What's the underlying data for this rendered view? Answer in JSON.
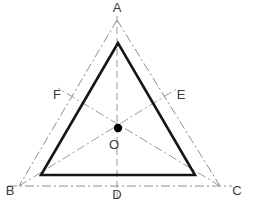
{
  "figure": {
    "type": "geometry-diagram",
    "canvas": {
      "width": 256,
      "height": 208,
      "background": "#ffffff"
    },
    "colors": {
      "construction_line": "#8d8d8d",
      "median_line": "#9a9a9a",
      "inner_triangle": "#161616",
      "centroid": "#000000",
      "label_text": "#3a3a3a"
    },
    "points": {
      "A": {
        "label": "A",
        "x": 117,
        "y": 20,
        "label_x": 117,
        "label_y": 8,
        "role": "outer-apex-top"
      },
      "B": {
        "label": "B",
        "x": 19,
        "y": 186,
        "label_x": 9,
        "label_y": 191,
        "role": "outer-vertex-bottom-left"
      },
      "C": {
        "label": "C",
        "x": 220,
        "y": 186,
        "label_x": 236,
        "label_y": 191,
        "role": "outer-vertex-bottom-right"
      },
      "D": {
        "label": "D",
        "x": 117,
        "y": 186,
        "label_x": 117,
        "label_y": 194,
        "role": "midpoint-BC"
      },
      "E": {
        "label": "E",
        "x": 169,
        "y": 103,
        "label_x": 180,
        "label_y": 96,
        "role": "midpoint-AC"
      },
      "F": {
        "label": "F",
        "x": 68,
        "y": 103,
        "label_x": 57,
        "label_y": 96,
        "role": "midpoint-AB"
      },
      "O": {
        "label": "O",
        "x": 118,
        "y": 128,
        "label_x": 114,
        "label_y": 145,
        "role": "centroid",
        "dot_radius": 4.2
      }
    },
    "outer_triangle": {
      "name": "ABC",
      "style": "dash-dot",
      "path": "M 117 20 L 19 186 L 220 186 Z"
    },
    "inner_triangle": {
      "name": "inscribed-bold-triangle",
      "style": "solid-bold",
      "path": "M 118 43 L 41 175 L 195 175 Z",
      "vertices": [
        {
          "x": 118,
          "y": 43
        },
        {
          "x": 41,
          "y": 175
        },
        {
          "x": 195,
          "y": 175
        }
      ]
    },
    "medians": [
      {
        "name": "median-A-D",
        "from": "A",
        "to": "D",
        "style": "dashed",
        "x1": 117,
        "y1": 20,
        "x2": 117,
        "y2": 196
      },
      {
        "name": "median-B-E",
        "from": "B",
        "to": "E",
        "style": "dash-dot",
        "x1": 19,
        "y1": 186,
        "x2": 178,
        "y2": 88
      },
      {
        "name": "median-C-F",
        "from": "C",
        "to": "F",
        "style": "dash-dot",
        "x1": 220,
        "y1": 186,
        "x2": 58,
        "y2": 88
      }
    ],
    "base_extension": {
      "name": "baseline-B-C",
      "style": "dash-dot",
      "x1": 8,
      "y1": 186,
      "x2": 232,
      "y2": 186
    },
    "labels": [
      "A",
      "B",
      "C",
      "D",
      "E",
      "F",
      "O"
    ]
  }
}
